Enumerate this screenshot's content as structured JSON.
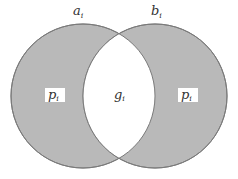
{
  "diagram": {
    "type": "venn-2-set",
    "colors": {
      "fill": "#b9b9b9",
      "stroke": "#7a7a7a",
      "intersection": "#ffffff",
      "label_box": "#ffffff",
      "text": "#333333"
    },
    "sets": [
      {
        "id": "a",
        "label_base": "a",
        "label_sub": "i",
        "center": [
          83,
          96
        ],
        "radius": 72
      },
      {
        "id": "b",
        "label_base": "b",
        "label_sub": "i",
        "center": [
          155,
          96
        ],
        "radius": 72
      }
    ],
    "regions": {
      "left_only": {
        "label_base": "p",
        "label_sub": "i"
      },
      "intersection": {
        "label_base": "g",
        "label_sub": "i"
      },
      "right_only": {
        "label_base": "p",
        "label_sub": "i"
      }
    }
  }
}
